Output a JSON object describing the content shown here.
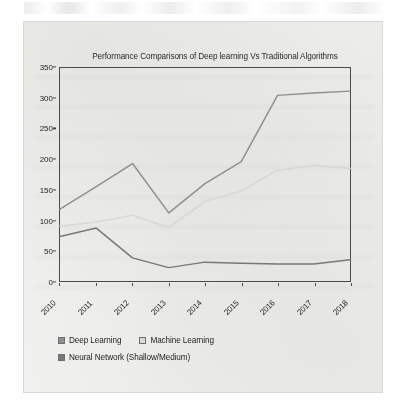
{
  "figure": {
    "title": "Performance Comparisons of Deep learning Vs Traditional Algorithms"
  },
  "legend": {
    "items": [
      {
        "label": "Deep Learning",
        "color": "#8f8f8f"
      },
      {
        "label": "Machine Learning",
        "color": "#d8d8d8"
      },
      {
        "label": "Neural Network (Shallow/Medium)",
        "color": "#777777"
      }
    ]
  },
  "chart_data": {
    "type": "line",
    "title": "Performance Comparisons of Deep learning Vs Traditional Algorithms",
    "xlabel": "",
    "ylabel": "",
    "categories": [
      "2010",
      "2011",
      "2012",
      "2013",
      "2014",
      "2015",
      "2016",
      "2017",
      "2018"
    ],
    "x_tick_labels": [
      "2010",
      "2011",
      "2012",
      "2013",
      "2014",
      "2015",
      "2016",
      "2017",
      "2018"
    ],
    "y_tick_labels": [
      "0",
      "50",
      "100",
      "150",
      "200",
      "250",
      "300",
      "350"
    ],
    "y_ticks": [
      0,
      50,
      100,
      150,
      200,
      250,
      300,
      350
    ],
    "ylim": [
      0,
      350
    ],
    "grid": false,
    "legend_position": "bottom-left",
    "series": [
      {
        "name": "Deep Learning",
        "color": "#8f8f8f",
        "values": [
          118,
          155,
          193,
          112,
          160,
          196,
          305,
          309,
          312
        ]
      },
      {
        "name": "Machine Learning",
        "color": "#d8d8d8",
        "values": [
          90,
          97,
          108,
          88,
          131,
          148,
          182,
          190,
          185
        ]
      },
      {
        "name": "Neural Network (Shallow/Medium)",
        "color": "#777777",
        "values": [
          73,
          87,
          38,
          22,
          31,
          29,
          28,
          28,
          35
        ]
      }
    ]
  }
}
